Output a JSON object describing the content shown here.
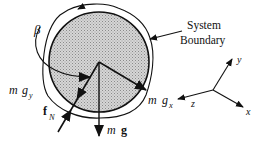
{
  "diagram": {
    "type": "free-body diagram",
    "labels": {
      "system_boundary_line1": "System",
      "system_boundary_line2": "Boundary",
      "angle": "β",
      "mass_m": "m",
      "gravity_g": "g",
      "gx_sub": "x",
      "gy_sub": "y",
      "normal_force_f": "f",
      "normal_force_sub": "N",
      "axis_x": "x",
      "axis_y": "y",
      "axis_z": "z"
    },
    "forces": [
      {
        "name": "weight",
        "label": "m g",
        "direction": "down"
      },
      {
        "name": "weight-x-component",
        "label": "m gx",
        "direction": "along x (down-right)"
      },
      {
        "name": "weight-y-component",
        "label": "m gy",
        "direction": "along y"
      },
      {
        "name": "normal-force",
        "label": "fN",
        "direction": "up-right"
      }
    ],
    "colors": {
      "ink": "#111111",
      "disk_fill": "#c8c8c8",
      "background": "#ffffff"
    }
  }
}
